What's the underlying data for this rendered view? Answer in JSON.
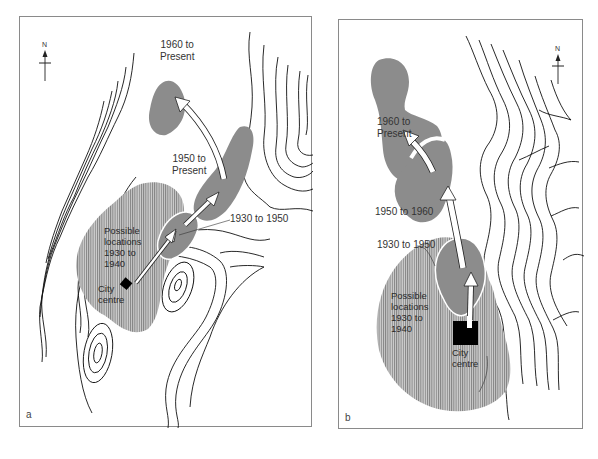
{
  "figure": {
    "colors": {
      "zone_fill": "#8c8c8c",
      "hatch_fill": "#b5b5b5",
      "contour": "#111111",
      "arrow_fill": "#ffffff",
      "city_centre": "#000000",
      "border": "#8a8a8a"
    },
    "panels": [
      {
        "id": "a",
        "letter": "a",
        "north_label": "N",
        "labels": {
          "zone_1960": [
            "1960 to",
            "Present"
          ],
          "zone_1950": [
            "1950 to",
            "Present"
          ],
          "zone_1930": "1930 to 1950",
          "possible": [
            "Possible",
            "locations",
            "1930 to",
            "1940"
          ],
          "city": [
            "City",
            "centre"
          ]
        }
      },
      {
        "id": "b",
        "letter": "b",
        "north_label": "N",
        "labels": {
          "zone_1960": [
            "1960 to",
            "Present"
          ],
          "zone_1950": "1950 to 1960",
          "zone_1930": "1930 to 1950",
          "possible": [
            "Possible",
            "locations",
            "1930 to",
            "1940"
          ],
          "city": [
            "City",
            "centre"
          ]
        }
      }
    ]
  }
}
